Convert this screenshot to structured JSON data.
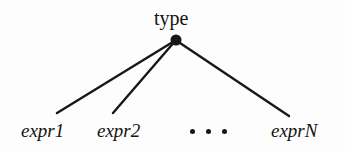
{
  "figure": {
    "kind": "tree-diagram",
    "background_color": "#fdfdfd",
    "ink_color": "#171717",
    "root": {
      "label": "type",
      "node_shape": "filled-circle",
      "node_center": {
        "x": 176,
        "y": 40
      },
      "node_radius": 5.5
    },
    "ellipsis": {
      "glyph": "...",
      "dot_count": 3,
      "meaning": "additional children omitted"
    },
    "children": [
      {
        "label": "expr1",
        "edge": {
          "x1": 176,
          "y1": 40,
          "x2": 57,
          "y2": 113
        },
        "has_edge": true
      },
      {
        "label": "expr2",
        "edge": {
          "x1": 176,
          "y1": 40,
          "x2": 113,
          "y2": 113
        },
        "has_edge": true
      },
      {
        "label": "exprN",
        "edge": {
          "x1": 177,
          "y1": 41,
          "x2": 289,
          "y2": 116
        },
        "has_edge": true
      }
    ],
    "edge_width": 2.4
  }
}
